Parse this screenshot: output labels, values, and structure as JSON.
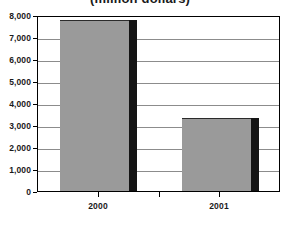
{
  "chart_data": {
    "type": "bar",
    "title": "(million dollars)",
    "xlabel": "",
    "ylabel": "",
    "categories": [
      "2000",
      "2001"
    ],
    "values": [
      7750,
      3300
    ],
    "series": [
      {
        "name": "",
        "values": [
          7750,
          3300
        ]
      }
    ],
    "ylim": [
      0,
      8000
    ],
    "y_ticks": [
      0,
      1000,
      2000,
      3000,
      4000,
      5000,
      6000,
      7000,
      8000
    ],
    "y_tick_labels": [
      "0",
      "1,000",
      "2,000",
      "3,000",
      "4,000",
      "5,000",
      "6,000",
      "7,000",
      "8,000"
    ],
    "grid": true,
    "legend": false,
    "legend_position": "none",
    "colors": {
      "bar_fill": "#9a9a9a",
      "bar_shadow": "#141414",
      "plot_border": "#000000",
      "gridline": "#8c8c8c",
      "text": "#1a1a1a",
      "background": "#ffffff"
    }
  }
}
